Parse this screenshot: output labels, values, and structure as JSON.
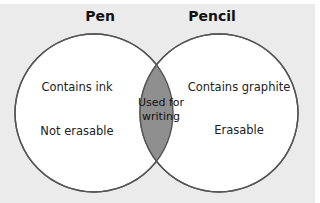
{
  "diagram": {
    "type": "venn",
    "colors": {
      "background": "#ebebeb",
      "circle_fill": "#ffffff",
      "intersection_fill": "#8f8f8f",
      "stroke": "#555555"
    },
    "sets": [
      {
        "title": "Pen",
        "items": [
          "Contains ink",
          "Not erasable"
        ]
      },
      {
        "title": "Pencil",
        "items": [
          "Contains graphite",
          "Erasable"
        ]
      }
    ],
    "intersection": {
      "line1": "Used for",
      "line2": "writing"
    }
  }
}
